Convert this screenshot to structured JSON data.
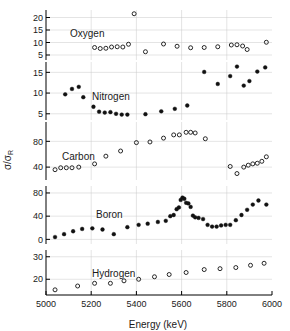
{
  "figure": {
    "xlabel": "Energy (keV)",
    "ylabel_main": "σ/σ",
    "ylabel_sub": "R",
    "ylabel_full": "σ/σR",
    "xlim": [
      5000,
      6000
    ],
    "xticks": [
      5000,
      5200,
      5400,
      5600,
      5800,
      6000
    ],
    "xticklabels": [
      "5000",
      "5200",
      "5400",
      "5600",
      "5800",
      "6000"
    ],
    "grid": true,
    "legend_position": "inline-panel-labels",
    "marker_open": "open-circle",
    "marker_filled": "filled-circle"
  },
  "chart_data": [
    {
      "type": "scatter",
      "title": "Oxygen",
      "panel": "oxygen",
      "marker": "open-circle",
      "xlabel": "",
      "ylabel": "σ/σR",
      "xlim": [
        5000,
        6000
      ],
      "ylim": [
        3,
        23
      ],
      "yticks": [
        5,
        10,
        15,
        20
      ],
      "yticklabels": [
        "5",
        "10",
        "15",
        "20"
      ],
      "x": [
        5215,
        5240,
        5265,
        5290,
        5315,
        5340,
        5365,
        5440,
        5520,
        5580,
        5640,
        5700,
        5760,
        5820,
        5845,
        5870,
        5890,
        5975
      ],
      "y": [
        8.0,
        7.6,
        7.7,
        8.2,
        8.3,
        8.2,
        9.3,
        6.3,
        9.4,
        8.5,
        7.9,
        8.0,
        8.3,
        9.0,
        9.1,
        8.6,
        7.2,
        10.1
      ],
      "x_outlier": [
        5390
      ],
      "y_outlier": [
        21.5
      ]
    },
    {
      "type": "scatter",
      "title": "Nitrogen",
      "panel": "nitrogen",
      "marker": "filled-circle",
      "xlabel": "",
      "ylabel": "σ/σR",
      "xlim": [
        5000,
        6000
      ],
      "ylim": [
        3.5,
        17.5
      ],
      "yticks": [
        5,
        10,
        15
      ],
      "yticklabels": [
        "5",
        "10",
        "15"
      ],
      "x": [
        5085,
        5115,
        5145,
        5165,
        5210,
        5235,
        5260,
        5285,
        5310,
        5335,
        5360,
        5440,
        5510,
        5570,
        5625,
        5700,
        5760,
        5815,
        5845,
        5875,
        5900,
        5935,
        5970
      ],
      "y": [
        9.7,
        11.0,
        11.5,
        9.0,
        6.7,
        5.5,
        5.3,
        5.4,
        5.0,
        4.8,
        4.8,
        4.9,
        5.6,
        6.2,
        7.0,
        15.1,
        12.2,
        14.1,
        16.4,
        11.8,
        12.9,
        15.2,
        16.2
      ]
    },
    {
      "type": "scatter",
      "title": "Carbon",
      "panel": "carbon",
      "marker": "open-circle",
      "xlabel": "",
      "ylabel": "σ/σR",
      "xlim": [
        5000,
        6000
      ],
      "ylim": [
        20,
        110
      ],
      "yticks": [
        40,
        80
      ],
      "yticklabels": [
        "40",
        "80"
      ],
      "x": [
        5040,
        5065,
        5090,
        5115,
        5145,
        5215,
        5265,
        5330,
        5400,
        5460,
        5520,
        5565,
        5590,
        5620,
        5640,
        5660,
        5705,
        5815,
        5845,
        5875,
        5895,
        5915,
        5935,
        5955,
        5975
      ],
      "y": [
        36,
        39,
        39,
        39,
        40,
        45,
        57,
        65,
        78,
        79,
        85,
        90,
        90,
        94,
        94,
        93,
        84,
        41,
        30,
        40,
        43,
        45,
        46,
        49,
        56
      ]
    },
    {
      "type": "scatter",
      "title": "Boron",
      "panel": "boron",
      "marker": "filled-circle",
      "xlabel": "",
      "ylabel": "σ/σR",
      "xlim": [
        5000,
        6000
      ],
      "ylim": [
        -8,
        92
      ],
      "yticks": [
        0,
        40,
        80
      ],
      "yticklabels": [
        "0",
        "40",
        "80"
      ],
      "x": [
        5040,
        5080,
        5120,
        5160,
        5205,
        5250,
        5300,
        5360,
        5410,
        5450,
        5495,
        5530,
        5550,
        5565,
        5578,
        5588,
        5596,
        5604,
        5612,
        5620,
        5630,
        5640,
        5650,
        5660,
        5675,
        5695,
        5715,
        5735,
        5755,
        5775,
        5795,
        5815,
        5840,
        5865,
        5890,
        5915,
        5940,
        5975
      ],
      "y": [
        4,
        9,
        14,
        18,
        19,
        17,
        9,
        21,
        25,
        27,
        30,
        32,
        40,
        42,
        52,
        55,
        68,
        72,
        70,
        63,
        62,
        56,
        41,
        38,
        37,
        35,
        25,
        22,
        22,
        24,
        25,
        25,
        33,
        42,
        51,
        60,
        67,
        60
      ]
    },
    {
      "type": "scatter",
      "title": "Hydrogen",
      "panel": "hydrogen",
      "marker": "open-circle",
      "xlabel": "Energy (keV)",
      "ylabel": "σ/σR",
      "xlim": [
        5000,
        6000
      ],
      "ylim": [
        13,
        33
      ],
      "yticks": [
        20,
        30
      ],
      "yticklabels": [
        "20",
        "30"
      ],
      "x": [
        5040,
        5140,
        5215,
        5285,
        5345,
        5410,
        5480,
        5545,
        5620,
        5700,
        5770,
        5840,
        5905,
        5965
      ],
      "y": [
        15.3,
        17.0,
        18.2,
        18.2,
        19.3,
        20.0,
        21.1,
        22.1,
        23.0,
        24.3,
        24.7,
        25.2,
        26.2,
        27.1
      ]
    }
  ]
}
